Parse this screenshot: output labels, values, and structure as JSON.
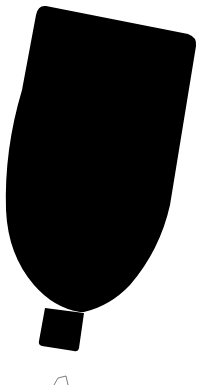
{
  "figure": {
    "fill_color": "#000000",
    "background_color": "#ffffff",
    "stroke_color": "#444444"
  }
}
